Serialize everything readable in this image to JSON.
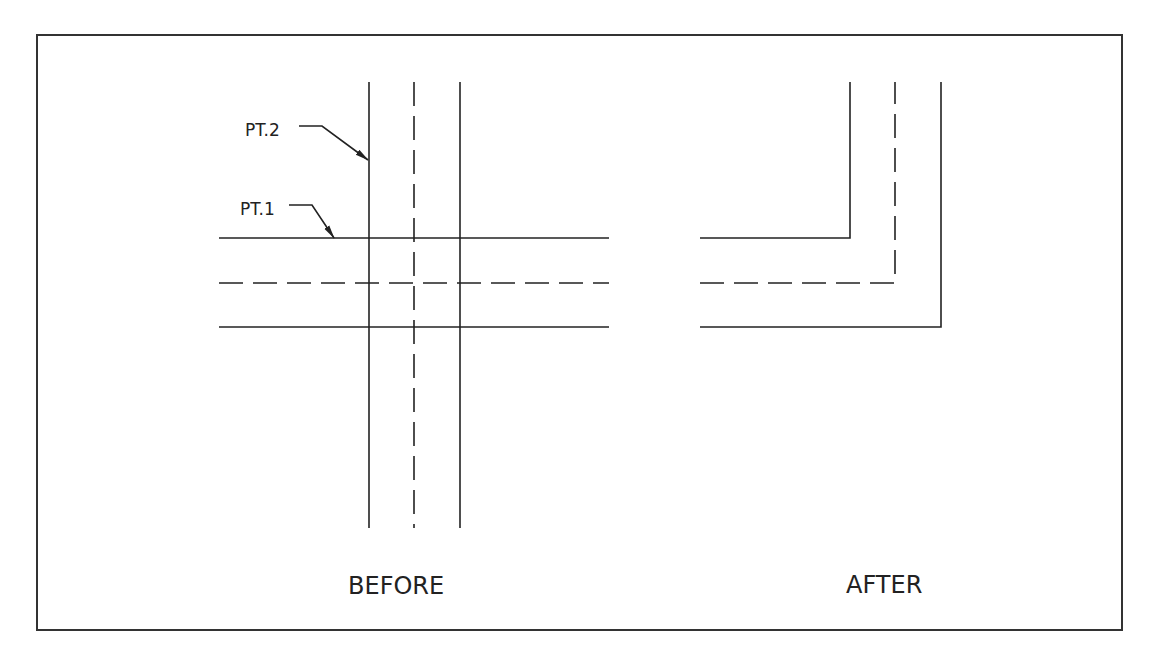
{
  "diagram": {
    "type": "cad-before-after",
    "frame": {
      "x": 37,
      "y": 35,
      "width": 1085,
      "height": 595
    },
    "before": {
      "caption": "BEFORE",
      "vertical_lines": [
        {
          "x": 369,
          "y1": 82,
          "y2": 528,
          "style": "solid"
        },
        {
          "x": 414,
          "y1": 82,
          "y2": 528,
          "style": "dashed"
        },
        {
          "x": 460,
          "y1": 82,
          "y2": 528,
          "style": "solid"
        }
      ],
      "horizontal_lines": [
        {
          "y": 238,
          "x1": 219,
          "x2": 609,
          "style": "solid"
        },
        {
          "y": 283,
          "x1": 219,
          "x2": 609,
          "style": "dashed"
        },
        {
          "y": 327,
          "x1": 219,
          "x2": 609,
          "style": "solid"
        }
      ],
      "callouts": [
        {
          "label": "PT.2",
          "text_x": 245,
          "text_y": 136,
          "leader": [
            [
              299,
              126
            ],
            [
              322,
              126
            ],
            [
              368,
              160
            ]
          ]
        },
        {
          "label": "PT.1",
          "text_x": 240,
          "text_y": 215,
          "leader": [
            [
              289,
              205
            ],
            [
              312,
              205
            ],
            [
              334,
              238
            ]
          ]
        }
      ]
    },
    "after": {
      "caption": "AFTER",
      "corners": [
        {
          "style": "solid",
          "points": [
            [
              700,
              238
            ],
            [
              850,
              238
            ],
            [
              850,
              82
            ]
          ]
        },
        {
          "style": "dashed",
          "points": [
            [
              700,
              283
            ],
            [
              895,
              283
            ],
            [
              895,
              82
            ]
          ]
        },
        {
          "style": "solid",
          "points": [
            [
              700,
              327
            ],
            [
              941,
              327
            ],
            [
              941,
              82
            ]
          ]
        }
      ]
    }
  },
  "labels": {
    "pt2": "PT.2",
    "pt1": "PT.1",
    "before": "BEFORE",
    "after": "AFTER"
  }
}
